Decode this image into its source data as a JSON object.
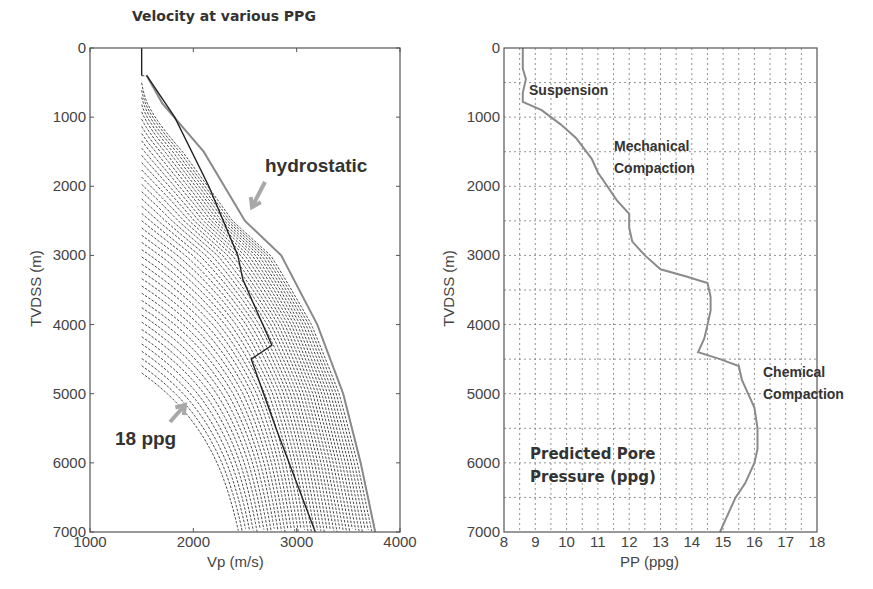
{
  "chart_data": [
    {
      "type": "line",
      "title": "Velocity at various  PPG",
      "xlabel": "Vp (m/s)",
      "ylabel": "TVDSS (m)",
      "xlim": [
        1000,
        4000
      ],
      "ylim": [
        7000,
        0
      ],
      "y_inverted": true,
      "xticks": [
        "1000",
        "2000",
        "3000",
        "4000"
      ],
      "yticks": [
        "0",
        "1000",
        "2000",
        "3000",
        "4000",
        "5000",
        "6000",
        "7000"
      ],
      "grid": false,
      "annotations": [
        {
          "text": "hydrostatic",
          "points_to": "rightmost (hydrostatic) velocity curve"
        },
        {
          "text": "18 ppg",
          "points_to": "leftmost (18 ppg) velocity curve"
        }
      ],
      "series": [
        {
          "name": "hydrostatic",
          "style": "solid gray",
          "depth": [
            400,
            800,
            1500,
            2500,
            3000,
            4000,
            5000,
            6000,
            7000
          ],
          "vp": [
            1550,
            1700,
            2100,
            2500,
            2850,
            3200,
            3450,
            3620,
            3760
          ]
        },
        {
          "name": "predicted velocity (from PP)",
          "style": "solid black",
          "depth": [
            400,
            1000,
            2000,
            3000,
            3350,
            4300,
            4500,
            5500,
            7000
          ],
          "vp": [
            1550,
            1820,
            2150,
            2430,
            2480,
            2760,
            2560,
            2800,
            3180
          ]
        },
        {
          "name": "18 ppg",
          "style": "dashed",
          "depth": [
            4700,
            5000,
            6000,
            7000
          ],
          "vp": [
            1520,
            1700,
            2250,
            2580
          ]
        },
        {
          "name": "intermediate PPG curves",
          "style": "dashed",
          "note": "family of ~40 dashed curves between 18 ppg and hydrostatic, starting at Vp≈1500 m/s at progressively deeper depths (≈400–4700 m)"
        }
      ]
    },
    {
      "type": "line",
      "title": "",
      "xlabel": "PP (ppg)",
      "ylabel": "TVDSS (m)",
      "xlim": [
        8,
        18
      ],
      "ylim": [
        7000,
        0
      ],
      "y_inverted": true,
      "xticks": [
        "8",
        "9",
        "10",
        "11",
        "12",
        "13",
        "14",
        "15",
        "16",
        "17",
        "18"
      ],
      "yticks": [
        "0",
        "1000",
        "2000",
        "3000",
        "4000",
        "5000",
        "6000",
        "7000"
      ],
      "grid": true,
      "annotations": [
        {
          "text": "Suspension"
        },
        {
          "text": "Mechanical Compaction"
        },
        {
          "text": "Chemical Compaction"
        },
        {
          "text": "Predicted Pore Pressure (ppg)"
        }
      ],
      "series": [
        {
          "name": "Predicted Pore Pressure",
          "depth": [
            0,
            300,
            450,
            650,
            780,
            900,
            1100,
            1300,
            1600,
            1800,
            2000,
            2200,
            2400,
            2600,
            2800,
            3000,
            3200,
            3300,
            3400,
            3600,
            3800,
            4000,
            4200,
            4400,
            4500,
            4600,
            4800,
            5000,
            5200,
            5500,
            5800,
            6000,
            6300,
            6500,
            6800,
            7000
          ],
          "pp": [
            8.6,
            8.6,
            8.7,
            8.6,
            8.6,
            9.2,
            9.8,
            10.3,
            10.8,
            11.0,
            11.3,
            11.6,
            12.0,
            12.0,
            12.1,
            12.5,
            13.0,
            13.8,
            14.5,
            14.6,
            14.6,
            14.5,
            14.4,
            14.2,
            14.9,
            15.5,
            15.6,
            15.8,
            16.0,
            16.1,
            16.1,
            16.0,
            15.7,
            15.4,
            15.1,
            14.9
          ]
        }
      ]
    }
  ],
  "left": {
    "title": "Velocity at various  PPG",
    "xlabel": "Vp (m/s)",
    "ylabel": "TVDSS (m)",
    "xticks": [
      "1000",
      "2000",
      "3000",
      "4000"
    ],
    "yticks": [
      "0",
      "1000",
      "2000",
      "3000",
      "4000",
      "5000",
      "6000",
      "7000"
    ],
    "anno_hydro": "hydrostatic",
    "anno_18": "18 ppg"
  },
  "right": {
    "xlabel": "PP (ppg)",
    "ylabel": "TVDSS (m)",
    "xticks": [
      "8",
      "9",
      "10",
      "11",
      "12",
      "13",
      "14",
      "15",
      "16",
      "17",
      "18"
    ],
    "yticks": [
      "0",
      "1000",
      "2000",
      "3000",
      "4000",
      "5000",
      "6000",
      "7000"
    ],
    "anno_suspension": "Suspension",
    "anno_mech_1": "Mechanical",
    "anno_mech_2": "Compaction",
    "anno_chem_1": "Chemical",
    "anno_chem_2": "Compaction",
    "anno_pp_1": "Predicted Pore",
    "anno_pp_2": "Pressure  (ppg)"
  },
  "colors": {
    "axis": "#555555",
    "curve_gray": "#8a8a8a",
    "curve_black": "#222222",
    "dashed": "#333333",
    "grid": "#777777",
    "arrow": "#a8a8a8"
  }
}
